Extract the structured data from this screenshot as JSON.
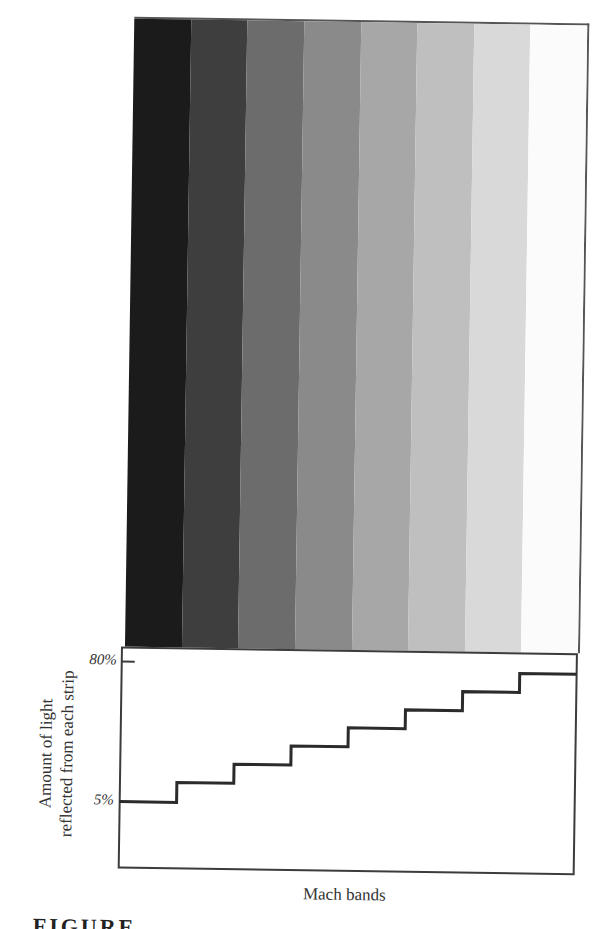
{
  "figure": {
    "caption_partial": "FIGURE",
    "strip_colors": [
      "#1b1b1b",
      "#3e3e3e",
      "#6c6c6c",
      "#8a8a8a",
      "#a7a7a7",
      "#bfbfbf",
      "#d9d9d9",
      "#fbfbfb"
    ],
    "border_color": "#3c3c3c",
    "line_color": "#2b2b2b"
  },
  "chart_data": {
    "type": "line",
    "subtype": "step",
    "title": "",
    "xlabel": "Mach bands",
    "ylabel": "Amount of light reflected from each strip",
    "ylabel_lines": [
      "Amount of light",
      "reflected from each strip"
    ],
    "yticks": [
      {
        "label": "80%",
        "value": 80
      },
      {
        "label": "5%",
        "value": 5
      }
    ],
    "ylim": [
      0,
      85
    ],
    "grid": false,
    "legend": null,
    "categories": [
      "Strip 1",
      "Strip 2",
      "Strip 3",
      "Strip 4",
      "Strip 5",
      "Strip 6",
      "Strip 7",
      "Strip 8"
    ],
    "series": [
      {
        "name": "Reflected light (%)",
        "values": [
          5,
          15.7,
          25.9,
          36.1,
          46.3,
          56.4,
          66.6,
          76.8
        ]
      }
    ]
  },
  "axis": {
    "tick_80": "80%",
    "tick_5": "5%",
    "ylabel_line1": "Amount of light",
    "ylabel_line2": "reflected from each strip",
    "xlabel": "Mach bands"
  }
}
